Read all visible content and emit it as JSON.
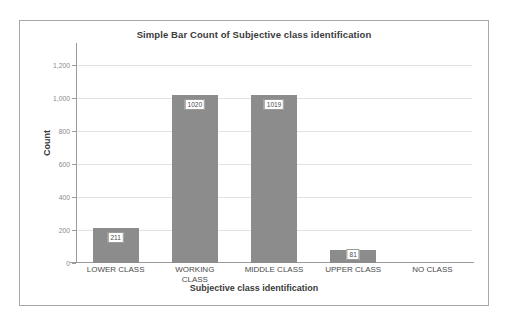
{
  "chart_data": {
    "type": "bar",
    "title": "Simple Bar Count of Subjective class identification",
    "xlabel": "Subjective class identification",
    "ylabel": "Count",
    "categories": [
      "LOWER CLASS",
      "WORKING CLASS",
      "MIDDLE CLASS",
      "UPPER CLASS",
      "NO CLASS"
    ],
    "values": [
      211,
      1020,
      1019,
      81,
      0
    ],
    "data_labels": [
      "211",
      "1020",
      "1019",
      "81",
      ""
    ],
    "ylim": [
      0,
      1300
    ],
    "yticks": [
      0,
      200,
      400,
      600,
      800,
      1000,
      1200
    ],
    "ytick_labels": [
      "0",
      "200",
      "400",
      "600",
      "800",
      "1,000",
      "1,200"
    ],
    "grid": true,
    "legend": false,
    "bar_color": "#8c8c8c",
    "gridline_color": "#e2e2e2",
    "axis_color": "#9a9a9a",
    "frame_color": "#a8a8a8",
    "background_color": "#ffffff"
  }
}
